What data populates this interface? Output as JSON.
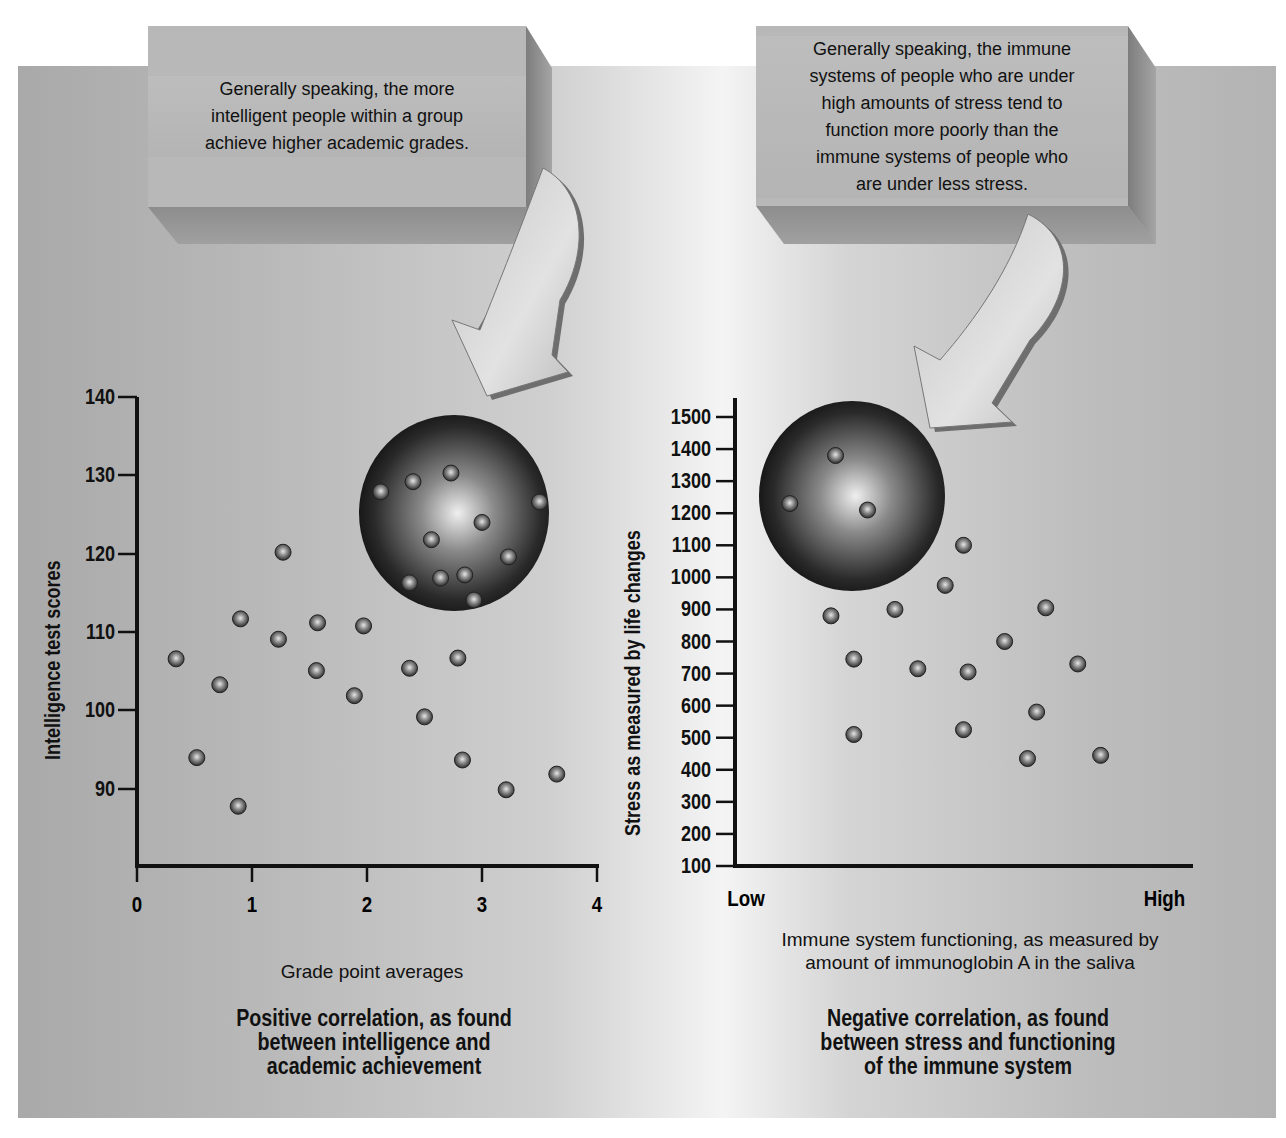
{
  "callouts": {
    "left": "Generally speaking, the more intelligent people within a group achieve higher academic grades.",
    "left_lines": [
      "Generally speaking, the more",
      "intelligent people within a group",
      "achieve higher academic grades."
    ],
    "right_lines": [
      "Generally speaking, the immune",
      "systems of people who are under",
      "high amounts of stress tend to",
      "function more poorly than the",
      "immune systems of people who",
      "are under less stress."
    ]
  },
  "left_chart": {
    "ylabel": "Intelligence test scores",
    "xlabel": "Grade point averages",
    "caption_lines": [
      "Positive correlation, as found",
      "between intelligence and",
      "academic achievement"
    ],
    "yticks": [
      "140",
      "130",
      "120",
      "110",
      "100",
      "90"
    ],
    "xticks": [
      "0",
      "1",
      "2",
      "3",
      "4"
    ]
  },
  "right_chart": {
    "ylabel": "Stress as measured by life changes",
    "xlabel_lines": [
      "Immune system functioning, as measured by",
      "amount of immunoglobin A in the saliva"
    ],
    "x_low": "Low",
    "x_high": "High",
    "caption_lines": [
      "Negative correlation, as found",
      "between stress and functioning",
      "of the immune system"
    ],
    "yticks": [
      "1500",
      "1400",
      "1300",
      "1200",
      "1100",
      "1000",
      "900",
      "800",
      "700",
      "600",
      "500",
      "400",
      "300",
      "200",
      "100"
    ]
  },
  "chart_data": [
    {
      "type": "scatter",
      "title": "Positive correlation, as found between intelligence and academic achievement",
      "xlabel": "Grade point averages",
      "ylabel": "Intelligence test scores",
      "xlim": [
        0,
        4
      ],
      "ylim": [
        80,
        140
      ],
      "xticks": [
        0,
        1,
        2,
        3,
        4
      ],
      "yticks": [
        90,
        100,
        110,
        120,
        130,
        140
      ],
      "grid": false,
      "highlight": {
        "label": "highlighted cluster (high GPA, high IQ)",
        "center": [
          2.8,
          124.5
        ]
      },
      "points": [
        [
          0.34,
          106.6
        ],
        [
          0.52,
          94.0
        ],
        [
          0.72,
          103.3
        ],
        [
          0.9,
          111.7
        ],
        [
          0.88,
          87.8
        ],
        [
          1.27,
          120.2
        ],
        [
          1.23,
          109.1
        ],
        [
          1.57,
          111.2
        ],
        [
          1.56,
          105.1
        ],
        [
          1.97,
          110.8
        ],
        [
          1.89,
          101.9
        ],
        [
          2.37,
          105.4
        ],
        [
          2.5,
          99.2
        ],
        [
          2.79,
          106.7
        ],
        [
          2.83,
          93.7
        ],
        [
          3.21,
          89.9
        ],
        [
          3.65,
          91.9
        ],
        [
          2.12,
          127.9
        ],
        [
          2.4,
          129.2
        ],
        [
          2.73,
          130.3
        ],
        [
          3.0,
          124.0
        ],
        [
          2.56,
          121.8
        ],
        [
          3.23,
          119.6
        ],
        [
          3.5,
          126.6
        ],
        [
          2.37,
          116.3
        ],
        [
          2.64,
          116.9
        ],
        [
          2.85,
          117.3
        ],
        [
          2.93,
          114.1
        ]
      ]
    },
    {
      "type": "scatter",
      "title": "Negative correlation, as found between stress and functioning of the immune system",
      "xlabel": "Immune system functioning, as measured by amount of immunoglobin A in the saliva",
      "ylabel": "Stress as measured by life changes",
      "xlim": [
        "Low",
        "High"
      ],
      "x_scale": "relative 0-1",
      "ylim": [
        100,
        1500
      ],
      "yticks": [
        100,
        200,
        300,
        400,
        500,
        600,
        700,
        800,
        900,
        1000,
        1100,
        1200,
        1300,
        1400,
        1500
      ],
      "grid": false,
      "highlight": {
        "label": "highlighted cluster (low immune, high stress)",
        "center": [
          0.25,
          1240
        ]
      },
      "points": [
        [
          0.12,
          1230
        ],
        [
          0.22,
          1380
        ],
        [
          0.29,
          1210
        ],
        [
          0.21,
          880
        ],
        [
          0.26,
          745
        ],
        [
          0.26,
          510
        ],
        [
          0.35,
          900
        ],
        [
          0.4,
          715
        ],
        [
          0.46,
          975
        ],
        [
          0.5,
          1100
        ],
        [
          0.5,
          525
        ],
        [
          0.51,
          705
        ],
        [
          0.59,
          800
        ],
        [
          0.64,
          435
        ],
        [
          0.66,
          580
        ],
        [
          0.68,
          905
        ],
        [
          0.75,
          730
        ],
        [
          0.8,
          445
        ]
      ]
    }
  ]
}
